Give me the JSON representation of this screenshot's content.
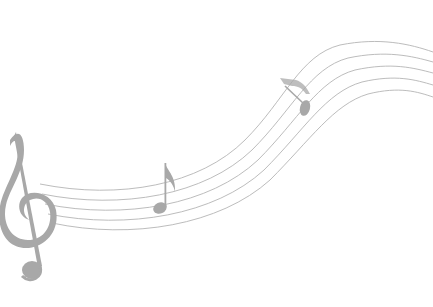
{
  "image": {
    "title": "Music staff with treble clef and notes",
    "description": "Flowing five-line music staff curving upward from left to right, with a treble clef at left, an eighth note in the middle and a second note on the upper curve",
    "colors": {
      "background": "#ffffff",
      "staff_line": "#b4b4b4",
      "glyph": "#a8a8a8"
    },
    "elements": [
      {
        "name": "treble-clef",
        "icon": "treble-clef-icon"
      },
      {
        "name": "eighth-note-middle",
        "icon": "eighth-note-icon"
      },
      {
        "name": "note-upper-right",
        "icon": "eighth-note-icon"
      },
      {
        "name": "staff",
        "lines": 5
      }
    ]
  }
}
